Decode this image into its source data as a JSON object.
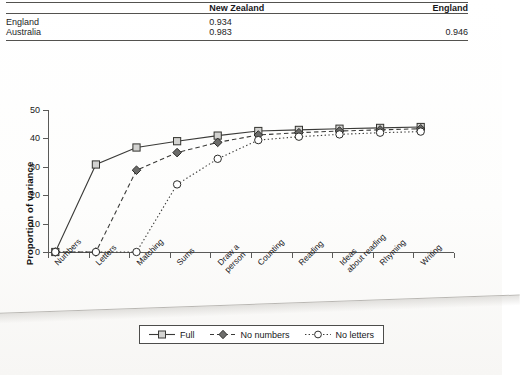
{
  "table": {
    "columns": [
      "",
      "New Zealand",
      "England"
    ],
    "rows": [
      {
        "label": "England",
        "new_zealand": "0.934",
        "england": ""
      },
      {
        "label": "Australia",
        "new_zealand": "0.983",
        "england": "0.946"
      }
    ]
  },
  "chart_data": {
    "type": "line",
    "title": "",
    "xlabel": "",
    "ylabel": "Proportion of variance",
    "ylim": [
      0,
      50
    ],
    "yticks": [
      0,
      10,
      20,
      30,
      40,
      50
    ],
    "grid": false,
    "legend_position": "bottom",
    "categories": [
      "Numbers",
      "Letters",
      "Matching",
      "Sums",
      "Draw a person",
      "Counting",
      "Reading",
      "Ideas about reading",
      "Rhyming",
      "Writing"
    ],
    "series": [
      {
        "name": "Full",
        "marker": "open-square",
        "line": "solid",
        "values": [
          0,
          30.8,
          36.8,
          39.0,
          41.0,
          42.6,
          43.0,
          43.4,
          43.7,
          44.0
        ]
      },
      {
        "name": "No numbers",
        "marker": "filled-diamond",
        "line": "dashed",
        "values": [
          0,
          0,
          28.8,
          35.0,
          38.6,
          41.2,
          42.0,
          42.6,
          43.0,
          43.4
        ]
      },
      {
        "name": "No letters",
        "marker": "open-circle",
        "line": "dotted",
        "values": [
          0,
          0,
          0,
          23.8,
          32.8,
          39.4,
          40.6,
          41.4,
          42.0,
          42.4
        ]
      }
    ]
  },
  "legend": {
    "items": [
      {
        "label": "Full"
      },
      {
        "label": "No numbers"
      },
      {
        "label": "No letters"
      }
    ]
  }
}
